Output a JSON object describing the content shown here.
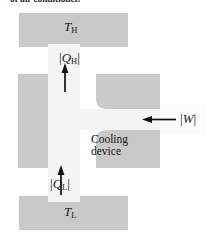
{
  "figure": {
    "caption_fragment": "of air conditioner.",
    "type": "thermodynamic-cycle-diagram"
  },
  "colors": {
    "reservoir_gray": "#c9c9c9",
    "body_gray": "#c9c9c9",
    "channel_light": "#f4f4f4",
    "arrow_black": "#111111",
    "background": "#ffffff"
  },
  "reservoirs": {
    "hot": {
      "label_symbol": "T",
      "label_subscript": "H",
      "name": "hot-reservoir"
    },
    "cold": {
      "label_symbol": "T",
      "label_subscript": "L",
      "name": "cold-reservoir"
    }
  },
  "device": {
    "line1": "Cooling",
    "line2": "device"
  },
  "flows": [
    {
      "id": "heat-out-hot",
      "symbol": "Q",
      "subscript": "H",
      "bar_left": "|",
      "bar_right": "|",
      "direction": "up",
      "description": "heat expelled to hot reservoir"
    },
    {
      "id": "heat-in-cold",
      "symbol": "Q",
      "subscript": "L",
      "bar_left": "|",
      "bar_right": "|",
      "direction": "up",
      "description": "heat absorbed from cold reservoir"
    },
    {
      "id": "work-input",
      "symbol": "W",
      "subscript": "",
      "bar_left": "|",
      "bar_right": "|",
      "direction": "left",
      "description": "work input to device"
    }
  ]
}
